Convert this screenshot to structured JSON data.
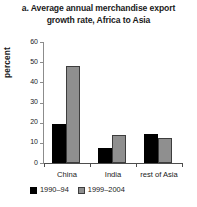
{
  "chart_data": {
    "type": "bar",
    "title": "a. Average annual merchandise export growth rate, Africa to Asia",
    "title_lines": [
      "a. Average annual merchandise export",
      "growth rate, Africa to Asia"
    ],
    "xlabel": "",
    "ylabel": "percent",
    "categories": [
      "China",
      "India",
      "rest of Asia"
    ],
    "series": [
      {
        "name": "1990–94",
        "color": "#000000",
        "values": [
          19.4,
          7.5,
          14.5
        ]
      },
      {
        "name": "1999–2004",
        "color": "#8f8f8f",
        "values": [
          48.3,
          14.0,
          12.5
        ]
      }
    ],
    "ylim": [
      0,
      60
    ],
    "yticks": [
      0,
      10,
      20,
      30,
      40,
      50,
      60
    ],
    "ytick_labels": [
      "0",
      "10",
      "20",
      "30",
      "40",
      "50",
      "60"
    ],
    "grid": false,
    "legend_position": "bottom-left"
  }
}
